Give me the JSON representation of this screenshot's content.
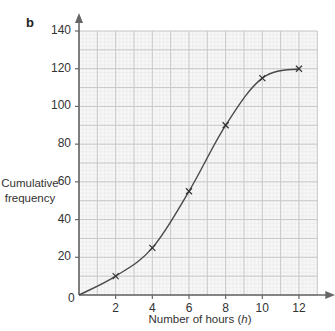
{
  "panel_label": "b",
  "chart_data": {
    "type": "line",
    "title": "",
    "panel": "b",
    "xlabel": "Number of hours (h)",
    "xlabel_prefix": "Number of hours (",
    "xlabel_var": "h",
    "xlabel_suffix": ")",
    "ylabel": "Cumulative frequency",
    "ylabel_lines": [
      "Cumulative",
      "frequency"
    ],
    "xlim": [
      0,
      13
    ],
    "ylim": [
      0,
      140
    ],
    "xticks": [
      0,
      2,
      4,
      6,
      8,
      10,
      12
    ],
    "yticks": [
      0,
      20,
      40,
      60,
      80,
      100,
      120,
      140
    ],
    "grid": true,
    "grid_major_x": 1,
    "grid_major_y": 10,
    "legend": null,
    "series": [
      {
        "name": "Cumulative frequency",
        "marker": "x",
        "smooth": true,
        "x": [
          0,
          2,
          4,
          6,
          8,
          10,
          12
        ],
        "y": [
          0,
          10,
          25,
          55,
          90,
          115,
          120
        ],
        "marked_points": [
          [
            2,
            10
          ],
          [
            4,
            25
          ],
          [
            6,
            55
          ],
          [
            8,
            90
          ],
          [
            10,
            115
          ],
          [
            12,
            120
          ]
        ]
      }
    ],
    "colors": {
      "curve": "#4a4a4a",
      "axis": "#666666",
      "grid_major": "#c8c8c8",
      "grid_minor": "#e6e6e6",
      "plot_bg": "#f7f7f7"
    }
  }
}
